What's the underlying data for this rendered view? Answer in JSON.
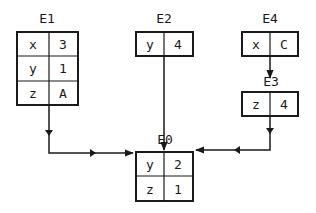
{
  "diagram": {
    "type": "environment-frames",
    "frames": [
      {
        "id": "E1",
        "label": "E1",
        "bindings": [
          {
            "var": "x",
            "val": "3"
          },
          {
            "var": "y",
            "val": "1"
          },
          {
            "var": "z",
            "val": "A"
          }
        ]
      },
      {
        "id": "E2",
        "label": "E2",
        "bindings": [
          {
            "var": "y",
            "val": "4"
          }
        ]
      },
      {
        "id": "E4",
        "label": "E4",
        "bindings": [
          {
            "var": "x",
            "val": "C"
          }
        ]
      },
      {
        "id": "E3",
        "label": "E3",
        "bindings": [
          {
            "var": "z",
            "val": "4"
          }
        ]
      },
      {
        "id": "E0",
        "label": "E0",
        "bindings": [
          {
            "var": "y",
            "val": "2"
          },
          {
            "var": "z",
            "val": "1"
          }
        ]
      }
    ],
    "edges": [
      {
        "from": "E1",
        "to": "E0"
      },
      {
        "from": "E2",
        "to": "E0"
      },
      {
        "from": "E4",
        "to": "E3"
      },
      {
        "from": "E3",
        "to": "E0"
      }
    ]
  }
}
